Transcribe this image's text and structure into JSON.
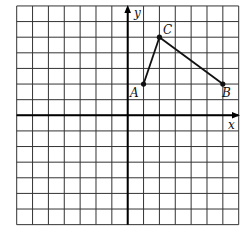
{
  "diagram": {
    "type": "coordinate-grid",
    "grid": {
      "x_min": -7,
      "x_max": 7,
      "y_min": -7,
      "y_max": 7,
      "step": 1
    },
    "axes": {
      "x_label": "x",
      "y_label": "y"
    },
    "points": [
      {
        "name": "A",
        "x": 1,
        "y": 2
      },
      {
        "name": "B",
        "x": 6,
        "y": 2
      },
      {
        "name": "C",
        "x": 2,
        "y": 5
      }
    ],
    "segments": [
      [
        "A",
        "C"
      ],
      [
        "C",
        "B"
      ]
    ],
    "colors": {
      "grid": "#333333",
      "axis": "#000000",
      "figure": "#111111"
    }
  }
}
